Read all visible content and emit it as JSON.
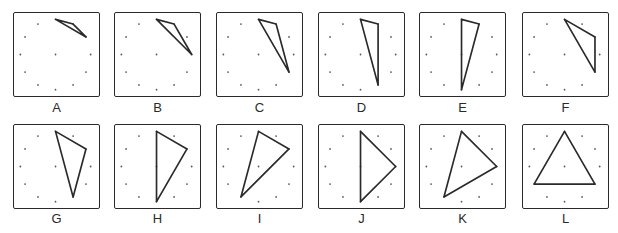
{
  "figure": {
    "peg_count": 12,
    "has_center_peg": true,
    "panels": [
      {
        "label": "A",
        "vertices": [
          0,
          1,
          2
        ]
      },
      {
        "label": "B",
        "vertices": [
          0,
          1,
          3
        ]
      },
      {
        "label": "C",
        "vertices": [
          0,
          1,
          4
        ]
      },
      {
        "label": "D",
        "vertices": [
          0,
          1,
          5
        ]
      },
      {
        "label": "E",
        "vertices": [
          0,
          1,
          6
        ]
      },
      {
        "label": "F",
        "vertices": [
          0,
          2,
          4
        ]
      },
      {
        "label": "G",
        "vertices": [
          0,
          2,
          5
        ]
      },
      {
        "label": "H",
        "vertices": [
          0,
          2,
          6
        ]
      },
      {
        "label": "I",
        "vertices": [
          0,
          2,
          7
        ]
      },
      {
        "label": "J",
        "vertices": [
          0,
          3,
          6
        ]
      },
      {
        "label": "K",
        "vertices": [
          0,
          3,
          7
        ]
      },
      {
        "label": "L",
        "vertices": [
          0,
          4,
          8
        ]
      }
    ]
  },
  "colors": {
    "stroke": "#2a2a2a",
    "dot": "#555555",
    "background": "#ffffff"
  }
}
